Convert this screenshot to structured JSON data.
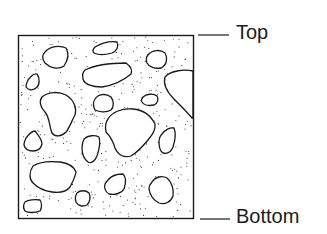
{
  "diagram": {
    "labels": {
      "top": "Top",
      "bottom": "Bottom"
    },
    "colors": {
      "stroke": "#1a1a1a",
      "background": "#ffffff"
    },
    "sample_box": {
      "x": 18,
      "y": 35,
      "width": 176,
      "height": 184
    },
    "stone_count": 18
  }
}
